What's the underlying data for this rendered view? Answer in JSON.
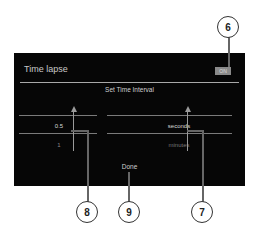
{
  "dialog": {
    "title": "Time lapse",
    "toggle_label": "ON",
    "subtitle": "Set Time Interval",
    "value_picker": {
      "selected": "0.5",
      "next": "1"
    },
    "unit_picker": {
      "selected": "seconds",
      "next": "minutes"
    },
    "done_label": "Done"
  },
  "callouts": [
    "6",
    "7",
    "8",
    "9"
  ]
}
